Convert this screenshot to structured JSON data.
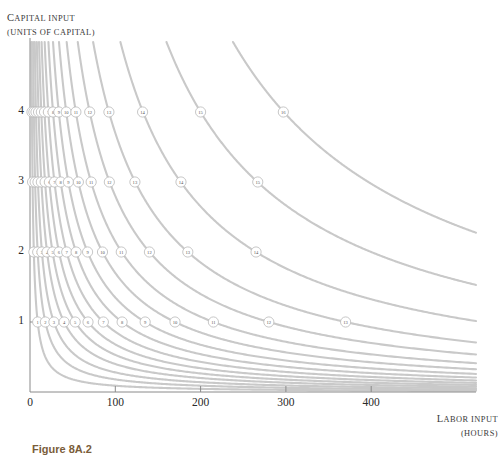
{
  "figure": {
    "caption": "Figure 8A.2",
    "colors": {
      "curve": "#c9c9c9",
      "axis": "#8a8a8a",
      "node_stroke": "#bdbdbd",
      "node_fill": "#ffffff",
      "text": "#2a2a2a",
      "caption_color": "#7a5d3a"
    }
  },
  "axes": {
    "y_title_line1_first": "C",
    "y_title_line1_rest": "APITAL INPUT",
    "y_title_line2": "(UNITS OF CAPITAL)",
    "x_title_line1_first": "L",
    "x_title_line1_rest": "ABOR INPUT",
    "x_title_line2": "(HOURS)",
    "x_ticks": [
      "0",
      "100",
      "200",
      "300",
      "400"
    ],
    "y_ticks": [
      "1",
      "2",
      "3",
      "4"
    ]
  },
  "chart_data": {
    "type": "line",
    "title": "Figure 8A.2",
    "xlabel": "Labor input (hours)",
    "ylabel": "Capital input (units of capital)",
    "xlim": [
      0,
      460
    ],
    "ylim": [
      0,
      4.75
    ],
    "grid": false,
    "legend": "none",
    "curve_labels": [
      1,
      2,
      3,
      4,
      5,
      6,
      7,
      8,
      9,
      10,
      11,
      12,
      13,
      14,
      15,
      16
    ],
    "series": [
      {
        "name": "1",
        "k": 9,
        "labels_at": [
          {
            "y": 1,
            "x": 9
          },
          {
            "y": 2,
            "x": 4.5
          },
          {
            "y": 3,
            "x": 3
          },
          {
            "y": 4,
            "x": 2.3
          }
        ]
      },
      {
        "name": "2",
        "k": 18,
        "labels_at": [
          {
            "y": 1,
            "x": 18
          },
          {
            "y": 2,
            "x": 9
          },
          {
            "y": 3,
            "x": 6
          },
          {
            "y": 4,
            "x": 4.5
          }
        ]
      },
      {
        "name": "3",
        "k": 28,
        "labels_at": [
          {
            "y": 1,
            "x": 28
          },
          {
            "y": 2,
            "x": 14
          },
          {
            "y": 3,
            "x": 9.3
          },
          {
            "y": 4,
            "x": 7
          }
        ]
      },
      {
        "name": "4",
        "k": 40,
        "labels_at": [
          {
            "y": 1,
            "x": 40
          },
          {
            "y": 2,
            "x": 20
          },
          {
            "y": 3,
            "x": 13.3
          },
          {
            "y": 4,
            "x": 10
          }
        ]
      },
      {
        "name": "5",
        "k": 53,
        "labels_at": [
          {
            "y": 1,
            "x": 53
          },
          {
            "y": 2,
            "x": 26.5
          },
          {
            "y": 3,
            "x": 17.7
          },
          {
            "y": 4,
            "x": 13.3
          }
        ]
      },
      {
        "name": "6",
        "k": 68,
        "labels_at": [
          {
            "y": 1,
            "x": 68
          },
          {
            "y": 2,
            "x": 34
          },
          {
            "y": 3,
            "x": 22.7
          },
          {
            "y": 4,
            "x": 17
          }
        ]
      },
      {
        "name": "7",
        "k": 86,
        "labels_at": [
          {
            "y": 1,
            "x": 86
          },
          {
            "y": 2,
            "x": 43
          },
          {
            "y": 3,
            "x": 28.7
          },
          {
            "y": 4,
            "x": 21.5
          }
        ]
      },
      {
        "name": "8",
        "k": 108,
        "labels_at": [
          {
            "y": 1,
            "x": 108
          },
          {
            "y": 2,
            "x": 54
          },
          {
            "y": 3,
            "x": 36
          },
          {
            "y": 4,
            "x": 27
          }
        ]
      },
      {
        "name": "9",
        "k": 135,
        "labels_at": [
          {
            "y": 1,
            "x": 135
          },
          {
            "y": 2,
            "x": 67.5
          },
          {
            "y": 3,
            "x": 45
          },
          {
            "y": 4,
            "x": 33.8
          }
        ]
      },
      {
        "name": "10",
        "k": 170,
        "labels_at": [
          {
            "y": 1,
            "x": 170
          },
          {
            "y": 2,
            "x": 85
          },
          {
            "y": 3,
            "x": 56.7
          },
          {
            "y": 4,
            "x": 42.5
          }
        ]
      },
      {
        "name": "11",
        "k": 215,
        "labels_at": [
          {
            "y": 1,
            "x": 215
          },
          {
            "y": 2,
            "x": 107
          },
          {
            "y": 3,
            "x": 71.7
          },
          {
            "y": 4,
            "x": 53.8
          }
        ]
      },
      {
        "name": "12",
        "k": 280,
        "labels_at": [
          {
            "y": 1,
            "x": 280
          },
          {
            "y": 2,
            "x": 140
          },
          {
            "y": 3,
            "x": 93
          },
          {
            "y": 4,
            "x": 70
          }
        ]
      },
      {
        "name": "13",
        "k": 370,
        "labels_at": [
          {
            "y": 1,
            "x": 370
          },
          {
            "y": 2,
            "x": 185
          },
          {
            "y": 3,
            "x": 123
          },
          {
            "y": 4,
            "x": 92.5
          }
        ]
      },
      {
        "name": "14",
        "k": 530,
        "labels_at": [
          {
            "y": 2,
            "x": 265
          },
          {
            "y": 3,
            "x": 177
          },
          {
            "y": 4,
            "x": 132
          }
        ]
      },
      {
        "name": "15",
        "k": 800,
        "labels_at": [
          {
            "y": 3,
            "x": 267
          },
          {
            "y": 4,
            "x": 200
          }
        ]
      },
      {
        "name": "16",
        "k": 1190,
        "labels_at": [
          {
            "y": 4,
            "x": 297
          }
        ]
      }
    ]
  }
}
